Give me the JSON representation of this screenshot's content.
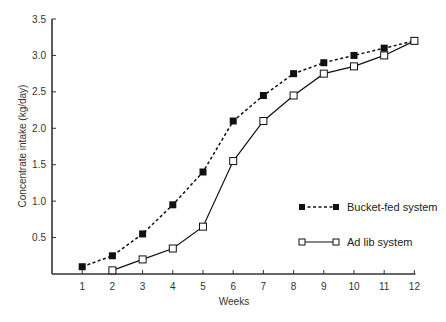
{
  "chart_data": {
    "type": "line",
    "title": "",
    "xlabel": "Weeks",
    "ylabel": "Concentrate intake (kg/day)",
    "x": [
      1,
      2,
      3,
      4,
      5,
      6,
      7,
      8,
      9,
      10,
      11,
      12
    ],
    "xticks": [
      "1",
      "2",
      "3",
      "4",
      "5",
      "6",
      "7",
      "8",
      "9",
      "10",
      "11",
      "12"
    ],
    "yticks": [
      "0.5",
      "1.0",
      "1.5",
      "2.0",
      "2.5",
      "3.0",
      "3.5"
    ],
    "ylim": [
      0,
      3.5
    ],
    "xlim": [
      0,
      12
    ],
    "grid": false,
    "legend_position": "right-center",
    "series": [
      {
        "name": "Bucket-fed system",
        "marker": "filled-square",
        "line": "dotted",
        "x": [
          1,
          2,
          3,
          4,
          5,
          6,
          7,
          8,
          9,
          10,
          11,
          12
        ],
        "values": [
          0.1,
          0.25,
          0.55,
          0.95,
          1.4,
          2.1,
          2.45,
          2.75,
          2.9,
          3.0,
          3.1,
          3.2
        ]
      },
      {
        "name": "Ad lib system",
        "marker": "open-square",
        "line": "solid",
        "x": [
          2,
          3,
          4,
          5,
          6,
          7,
          8,
          9,
          10,
          11,
          12
        ],
        "values": [
          0.05,
          0.2,
          0.35,
          0.65,
          1.55,
          2.1,
          2.45,
          2.75,
          2.85,
          3.0,
          3.2
        ]
      }
    ]
  },
  "legend": {
    "items": [
      {
        "label": "Bucket-fed system"
      },
      {
        "label": "Ad lib system"
      }
    ]
  },
  "colors": {
    "axis": "#333333",
    "series": "#111111"
  }
}
